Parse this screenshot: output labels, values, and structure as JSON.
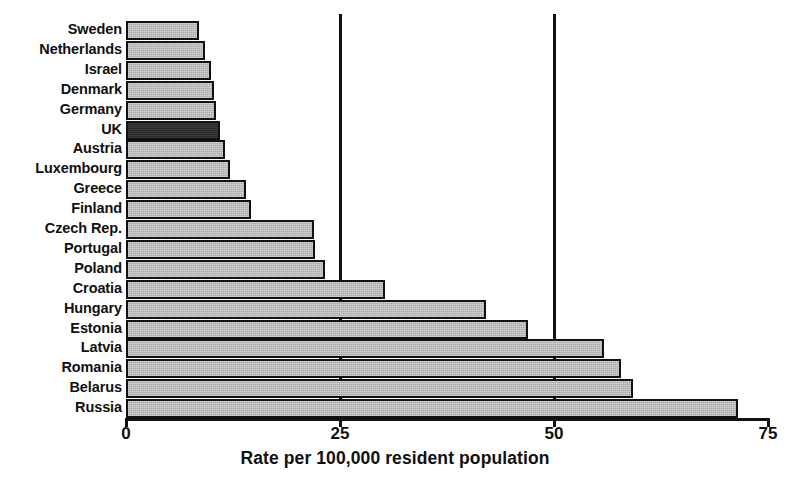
{
  "chart_data": {
    "type": "bar",
    "orientation": "horizontal",
    "title": "",
    "xlabel": "Rate per 100,000 resident population",
    "ylabel": "",
    "xlim": [
      0,
      75
    ],
    "xticks": [
      0,
      25,
      50,
      75
    ],
    "xtick_labels": [
      "0",
      "25",
      "50",
      "75"
    ],
    "grid": true,
    "gridlines_at": [
      25,
      50
    ],
    "legend": null,
    "categories": [
      "Sweden",
      "Netherlands",
      "Israel",
      "Denmark",
      "Germany",
      "UK",
      "Austria",
      "Luxembourg",
      "Greece",
      "Finland",
      "Czech Rep.",
      "Portugal",
      "Poland",
      "Croatia",
      "Hungary",
      "Estonia",
      "Latvia",
      "Romania",
      "Belarus",
      "Russia"
    ],
    "values": [
      8.5,
      9.2,
      9.9,
      10.3,
      10.5,
      11.0,
      11.6,
      12.1,
      14.0,
      14.6,
      22.0,
      22.1,
      23.2,
      30.3,
      42.1,
      47.0,
      55.8,
      57.8,
      59.2,
      71.5
    ],
    "highlight_category": "UK",
    "colors": {
      "bar_fill": "#a9a9a9",
      "bar_highlight_fill": "#2b2b2b",
      "bar_stroke": "#111111",
      "axis": "#111111",
      "text": "#101010",
      "background": "#ffffff"
    }
  }
}
